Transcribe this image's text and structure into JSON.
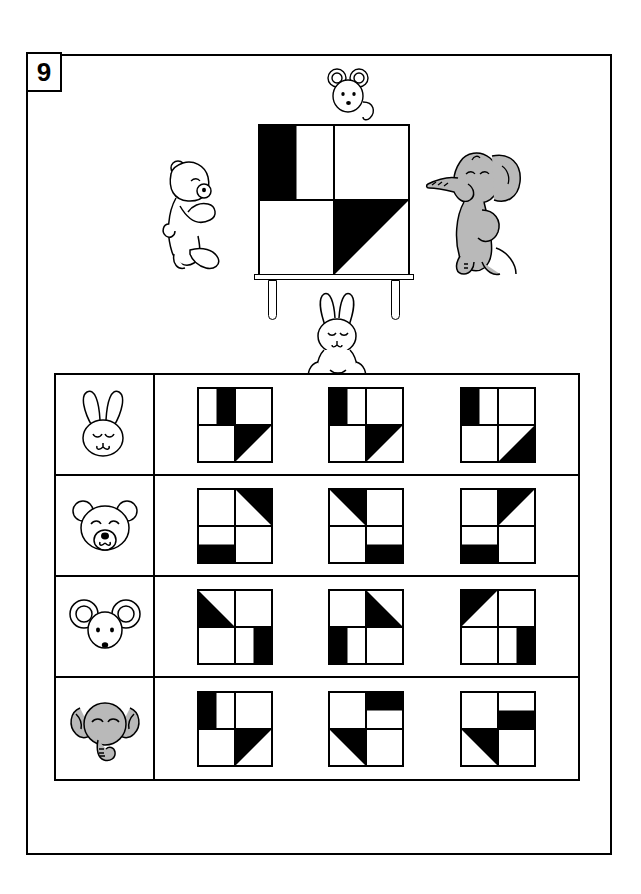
{
  "page": {
    "number": "9"
  },
  "scene": {
    "label": "animals-looking-at-board",
    "board_name": "pattern-board",
    "characters": [
      {
        "name": "mouse",
        "position": "top-of-board"
      },
      {
        "name": "bear",
        "position": "left-of-board"
      },
      {
        "name": "elephant",
        "position": "right-of-board"
      },
      {
        "name": "bunny",
        "position": "below-board"
      }
    ],
    "board_pattern": {
      "tl": "half-left",
      "tr": "empty",
      "bl": "empty",
      "br": "tri-tl"
    }
  },
  "table": {
    "rows": [
      {
        "animal": "bunny",
        "animal_label": "bunny-head-icon",
        "options": [
          {
            "tl": "half-right",
            "tr": "empty",
            "bl": "empty",
            "br": "tri-tl"
          },
          {
            "tl": "half-left",
            "tr": "empty",
            "bl": "empty",
            "br": "tri-tl"
          },
          {
            "tl": "half-left",
            "tr": "empty",
            "bl": "empty",
            "br": "tri-br"
          }
        ]
      },
      {
        "animal": "bear",
        "animal_label": "bear-head-icon",
        "options": [
          {
            "tl": "empty",
            "tr": "tri-tr",
            "bl": "half-bottom",
            "br": "empty"
          },
          {
            "tl": "tri-tr",
            "tr": "empty",
            "bl": "empty",
            "br": "half-bottom"
          },
          {
            "tl": "empty",
            "tr": "tri-tl",
            "bl": "half-bottom",
            "br": "empty"
          }
        ]
      },
      {
        "animal": "mouse",
        "animal_label": "mouse-head-icon",
        "options": [
          {
            "tl": "tri-bl",
            "tr": "empty",
            "bl": "empty",
            "br": "half-right"
          },
          {
            "tl": "empty",
            "tr": "tri-bl",
            "bl": "half-left",
            "br": "empty"
          },
          {
            "tl": "tri-tl",
            "tr": "empty",
            "bl": "empty",
            "br": "half-right"
          }
        ]
      },
      {
        "animal": "elephant",
        "animal_label": "elephant-head-icon",
        "options": [
          {
            "tl": "half-left",
            "tr": "empty",
            "bl": "empty",
            "br": "tri-tl"
          },
          {
            "tl": "empty",
            "tr": "half-top",
            "bl": "tri-tr",
            "br": "empty"
          },
          {
            "tl": "empty",
            "tr": "half-bottom",
            "bl": "tri-tr",
            "br": "empty"
          }
        ]
      }
    ]
  },
  "colors": {
    "ink": "#000000",
    "paper": "#ffffff",
    "elephant_gray": "#b9b9b9",
    "elephant_gray_dark": "#a0a0a0"
  }
}
